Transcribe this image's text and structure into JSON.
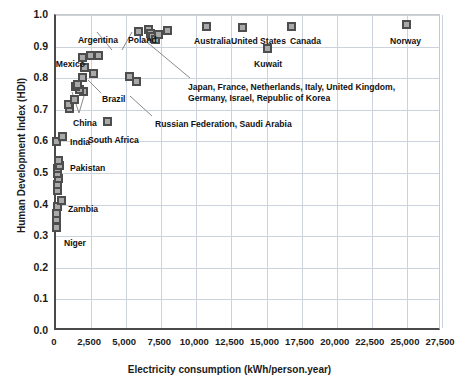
{
  "chart_data": {
    "type": "scatter",
    "title": "",
    "xlabel": "Electricity consumption (kWh/person.year)",
    "ylabel": "Human Development Index (HDI)",
    "xlim": [
      0,
      27500
    ],
    "ylim": [
      0.0,
      1.0
    ],
    "grid": true,
    "legend": "none",
    "xticks": [
      "0",
      "2,500",
      "5,000",
      "7,500",
      "10,000",
      "12,500",
      "15,000",
      "17,500",
      "20,000",
      "22,500",
      "25,000",
      "27,500"
    ],
    "xtick_values": [
      0,
      2500,
      5000,
      7500,
      10000,
      12500,
      15000,
      17500,
      20000,
      22500,
      25000,
      27500
    ],
    "yticks": [
      "0.0",
      "0.1",
      "0.2",
      "0.3",
      "0.4",
      "0.5",
      "0.6",
      "0.7",
      "0.8",
      "0.9",
      "1.0"
    ],
    "ytick_values": [
      0.0,
      0.1,
      0.2,
      0.3,
      0.4,
      0.5,
      0.6,
      0.7,
      0.8,
      0.9,
      1.0
    ],
    "points": [
      {
        "x": 210,
        "y": 0.325,
        "name": "Niger"
      },
      {
        "x": 190,
        "y": 0.35,
        "name": ""
      },
      {
        "x": 180,
        "y": 0.37,
        "name": ""
      },
      {
        "x": 260,
        "y": 0.39,
        "name": ""
      },
      {
        "x": 560,
        "y": 0.41,
        "name": "Zambia"
      },
      {
        "x": 240,
        "y": 0.44,
        "name": ""
      },
      {
        "x": 230,
        "y": 0.462,
        "name": ""
      },
      {
        "x": 300,
        "y": 0.48,
        "name": ""
      },
      {
        "x": 250,
        "y": 0.495,
        "name": ""
      },
      {
        "x": 280,
        "y": 0.51,
        "name": ""
      },
      {
        "x": 420,
        "y": 0.522,
        "name": "Pakistan"
      },
      {
        "x": 300,
        "y": 0.535,
        "name": ""
      },
      {
        "x": 210,
        "y": 0.598,
        "name": ""
      },
      {
        "x": 640,
        "y": 0.612,
        "name": "India"
      },
      {
        "x": 1100,
        "y": 0.7,
        "name": ""
      },
      {
        "x": 1000,
        "y": 0.715,
        "name": ""
      },
      {
        "x": 1450,
        "y": 0.73,
        "name": ""
      },
      {
        "x": 2100,
        "y": 0.755,
        "name": ""
      },
      {
        "x": 1850,
        "y": 0.762,
        "name": ""
      },
      {
        "x": 1500,
        "y": 0.772,
        "name": "China"
      },
      {
        "x": 1700,
        "y": 0.778,
        "name": ""
      },
      {
        "x": 2050,
        "y": 0.8,
        "name": ""
      },
      {
        "x": 2800,
        "y": 0.812,
        "name": "Brazil"
      },
      {
        "x": 2150,
        "y": 0.832,
        "name": ""
      },
      {
        "x": 2050,
        "y": 0.862,
        "name": "Mexico"
      },
      {
        "x": 2600,
        "y": 0.868,
        "name": ""
      },
      {
        "x": 3150,
        "y": 0.868,
        "name": ""
      },
      {
        "x": 3800,
        "y": 0.66,
        "name": "South Africa"
      },
      {
        "x": 5400,
        "y": 0.803,
        "name": "Russian Federation"
      },
      {
        "x": 5850,
        "y": 0.787,
        "name": "Saudi Arabia"
      },
      {
        "x": 6050,
        "y": 0.944,
        "name": ""
      },
      {
        "x": 6750,
        "y": 0.952,
        "name": ""
      },
      {
        "x": 6900,
        "y": 0.938,
        "name": ""
      },
      {
        "x": 7050,
        "y": 0.93,
        "name": ""
      },
      {
        "x": 7200,
        "y": 0.92,
        "name": ""
      },
      {
        "x": 7450,
        "y": 0.935,
        "name": ""
      },
      {
        "x": 8100,
        "y": 0.948,
        "name": ""
      },
      {
        "x": 10900,
        "y": 0.962,
        "name": "Australia"
      },
      {
        "x": 13400,
        "y": 0.956,
        "name": "United States"
      },
      {
        "x": 15200,
        "y": 0.891,
        "name": "Kuwait"
      },
      {
        "x": 16900,
        "y": 0.961,
        "name": "Canada"
      },
      {
        "x": 25100,
        "y": 0.968,
        "name": "Norway"
      }
    ],
    "point_labels": [
      {
        "text": "Argentina",
        "x": 118,
        "y": 35,
        "anchor": "end"
      },
      {
        "text": "Poland",
        "x": 128,
        "y": 35,
        "anchor": "start"
      },
      {
        "text": "Mexico",
        "x": 85,
        "y": 59,
        "anchor": "end"
      },
      {
        "text": "Brazil",
        "x": 102,
        "y": 94,
        "anchor": "start"
      },
      {
        "text": "China",
        "x": 73,
        "y": 118,
        "anchor": "start"
      },
      {
        "text": "India",
        "x": 70,
        "y": 137,
        "anchor": "start"
      },
      {
        "text": "Pakistan",
        "x": 70,
        "y": 163,
        "anchor": "start"
      },
      {
        "text": "Zambia",
        "x": 68,
        "y": 204,
        "anchor": "start"
      },
      {
        "text": "Niger",
        "x": 64,
        "y": 238,
        "anchor": "start"
      },
      {
        "text": "South Africa",
        "x": 88,
        "y": 135,
        "anchor": "start"
      },
      {
        "text": "Australia",
        "x": 194,
        "y": 36,
        "anchor": "start"
      },
      {
        "text": "United States",
        "x": 231,
        "y": 36,
        "anchor": "start"
      },
      {
        "text": "Kuwait",
        "x": 254,
        "y": 59,
        "anchor": "start"
      },
      {
        "text": "Canada",
        "x": 290,
        "y": 36,
        "anchor": "start"
      },
      {
        "text": "Norway",
        "x": 390,
        "y": 36,
        "anchor": "start"
      }
    ],
    "annotations": [
      {
        "text": "Japan, France, Netherlands, Italy, United Kingdom,",
        "x": 188,
        "y": 82
      },
      {
        "text": "Germany, Israel, Republic of Korea",
        "x": 188,
        "y": 93
      },
      {
        "text": "Russian Federation, Saudi Arabia",
        "x": 155,
        "y": 119
      }
    ]
  },
  "style": {
    "marker_fill": "#a9a9a9",
    "marker_edge": "#4d4d4d",
    "grid_color": "#cdd3dd",
    "axis_color": "#4a4a4a",
    "text_color": "#1a1a1a",
    "background": "#ffffff"
  }
}
